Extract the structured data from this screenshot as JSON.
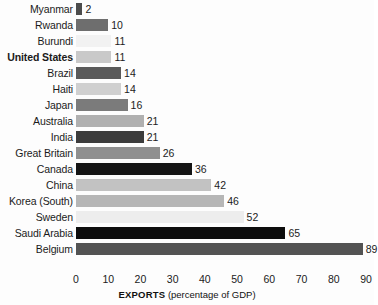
{
  "chart_data": {
    "type": "bar",
    "orientation": "horizontal",
    "title": "",
    "xlabel": "EXPORTS (percentage of GDP)",
    "xlabel_strong": "EXPORTS",
    "xlabel_light": "(percentage of GDP)",
    "ylabel": "",
    "xlim": [
      0,
      90
    ],
    "xticks": [
      0,
      10,
      20,
      30,
      40,
      50,
      60,
      70,
      80,
      90
    ],
    "grid": false,
    "legend": "none",
    "categories": [
      "Myanmar",
      "Rwanda",
      "Burundi",
      "United States",
      "Brazil",
      "Haiti",
      "Japan",
      "Australia",
      "India",
      "Great Britain",
      "Canada",
      "China",
      "Korea (South)",
      "Sweden",
      "Saudi Arabia",
      "Belgium"
    ],
    "values": [
      2,
      10,
      11,
      11,
      14,
      14,
      16,
      21,
      21,
      26,
      36,
      42,
      46,
      52,
      65,
      89
    ],
    "bar_colors": [
      "#4c4c4c",
      "#6e6e6e",
      "#f2f2f2",
      "#c9c9c9",
      "#5a5a5a",
      "#d0d0d0",
      "#7b7b7b",
      "#b0b0b0",
      "#3c3c3c",
      "#8f8f8f",
      "#151515",
      "#c2c2c2",
      "#b6b6b6",
      "#ededed",
      "#0d0d0d",
      "#535353"
    ],
    "emphasized_category": "United States"
  }
}
